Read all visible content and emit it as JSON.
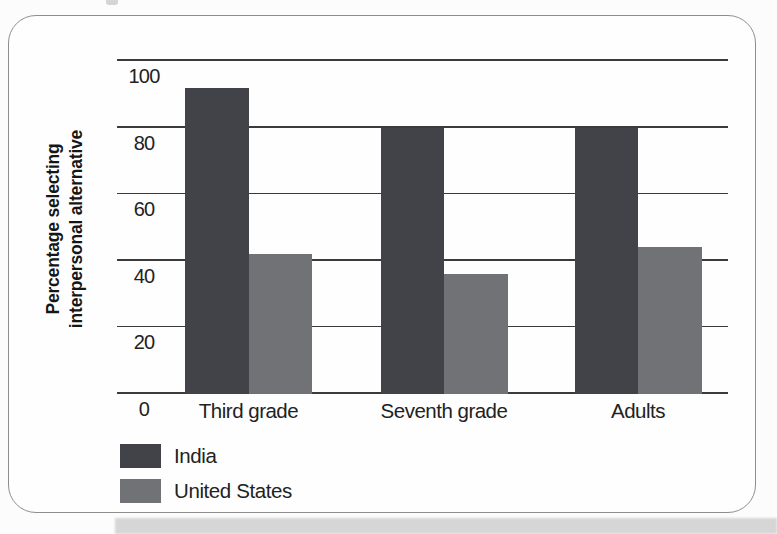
{
  "figure": {
    "kind": "scanned-textbook-bar-chart"
  },
  "colors": {
    "india_bar": "#414349",
    "us_bar": "#717276",
    "gridline": "#3a3a3a",
    "card_border": "#8e8e8e",
    "shadow_strip": "#d6d6d6"
  },
  "chart_data": {
    "type": "bar",
    "categories": [
      "Third grade",
      "Seventh grade",
      "Adults"
    ],
    "series": [
      {
        "name": "India",
        "color": "#414349",
        "values": [
          92,
          80,
          80
        ]
      },
      {
        "name": "United States",
        "color": "#717276",
        "values": [
          42,
          36,
          44
        ]
      }
    ],
    "title": "",
    "xlabel": "",
    "ylabel": "Percentage selecting interpersonal alternative",
    "ylim": [
      0,
      100
    ],
    "yticks": [
      100,
      80,
      60,
      40,
      20,
      0
    ],
    "grid": true,
    "legend_position": "bottom-left",
    "legend": [
      "India",
      "United States"
    ]
  }
}
